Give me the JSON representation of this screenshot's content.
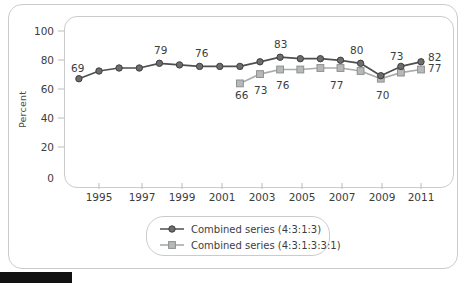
{
  "chart_data": {
    "type": "line",
    "title": "",
    "xlabel": "",
    "ylabel": "Percent",
    "ylim": [
      0,
      100
    ],
    "xlim": [
      1993.4,
      2011.8
    ],
    "yticks": [
      0,
      20,
      40,
      60,
      80,
      100
    ],
    "xticks": [
      1995,
      1997,
      1999,
      2001,
      2003,
      2005,
      2007,
      2009,
      2011
    ],
    "grid": false,
    "legend_position": "bottom-center",
    "series": [
      {
        "name": "Combined series (4:3:1:3)",
        "marker": "circle",
        "color": "#5a5a5a",
        "x": [
          1994,
          1995,
          1996,
          1997,
          1998,
          1999,
          2000,
          2001,
          2002,
          2003,
          2004,
          2005,
          2006,
          2007,
          2008,
          2009,
          2010,
          2011
        ],
        "values": [
          69,
          74,
          76,
          76,
          79,
          78,
          77,
          77,
          77,
          80,
          83,
          82,
          82,
          81,
          79,
          71,
          77,
          80
        ],
        "point_labels": [
          {
            "x": 1994,
            "value": 69,
            "text": "69",
            "position": "above-left"
          },
          {
            "x": 1998,
            "value": 79,
            "text": "79",
            "position": "above"
          },
          {
            "x": 2000,
            "value": 78,
            "text": "76",
            "position": "above"
          },
          {
            "x": 2004,
            "value": 83,
            "text": "83",
            "position": "above"
          },
          {
            "x": 2008,
            "value": 79,
            "text": "80",
            "position": "above"
          },
          {
            "x": 2011,
            "value": 80,
            "text": "82",
            "position": "right"
          }
        ]
      },
      {
        "name": "Combined series (4:3:1:3:3:1)",
        "marker": "square",
        "color": "#a8aaac",
        "x": [
          2002,
          2003,
          2004,
          2005,
          2006,
          2007,
          2008,
          2009,
          2010,
          2011
        ],
        "values": [
          66,
          72,
          75,
          75,
          76,
          76,
          74,
          69,
          73,
          75
        ],
        "point_labels": [
          {
            "x": 2002,
            "value": 66,
            "text": "66",
            "position": "below"
          },
          {
            "x": 2003,
            "value": 72,
            "text": "73",
            "position": "below-right"
          },
          {
            "x": 2004,
            "value": 75,
            "text": "76",
            "position": "below-right"
          },
          {
            "x": 2007,
            "value": 76,
            "text": "77",
            "position": "below"
          },
          {
            "x": 2009,
            "value": 69,
            "text": "70",
            "position": "below"
          },
          {
            "x": 2009.6,
            "value": 73,
            "text": "73",
            "position": "above"
          },
          {
            "x": 2011,
            "value": 75,
            "text": "77",
            "position": "right"
          }
        ]
      }
    ]
  },
  "axes": {
    "y_title": "Percent",
    "y_tick_labels": [
      "100",
      "80",
      "60",
      "40",
      "20",
      "0"
    ],
    "x_tick_labels": [
      "1995",
      "1997",
      "1999",
      "2001",
      "2003",
      "2005",
      "2007",
      "2009",
      "2011"
    ]
  },
  "legend": {
    "items": [
      {
        "label": "Combined series (4:3:1:3)",
        "marker": "circle",
        "color": "#5a5a5a"
      },
      {
        "label": "Combined series (4:3:1:3:3:1)",
        "marker": "square",
        "color": "#a8aaac"
      }
    ]
  },
  "annotations": {
    "labels_series1": [
      "69",
      "79",
      "76",
      "83",
      "80",
      "82"
    ],
    "labels_series2": [
      "66",
      "73",
      "76",
      "77",
      "70",
      "73",
      "77"
    ]
  },
  "colors": {
    "series1": "#5a5a5a",
    "series2": "#a8aaac",
    "frame": "#c9cbcd",
    "text": "#3d3d3d",
    "background": "#ffffff"
  }
}
